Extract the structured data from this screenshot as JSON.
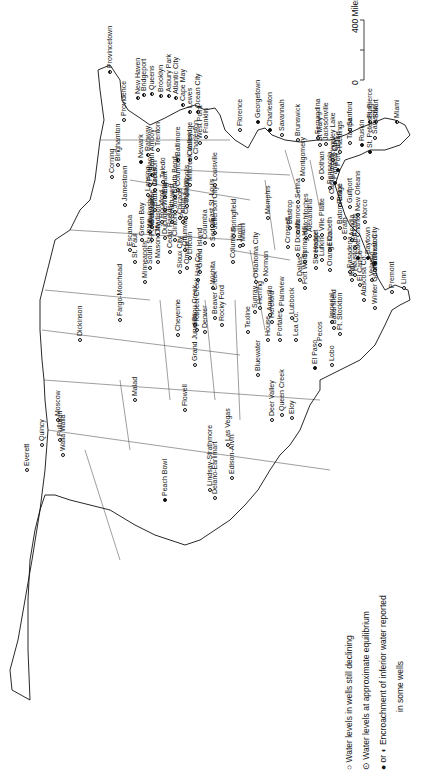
{
  "map": {
    "orientation": "rotated 90 degrees counter-clockwise",
    "scale_bar": {
      "start": "0",
      "end": "400 Miles"
    },
    "legend": [
      {
        "symbol": "open-circle",
        "text": "Water levels in wells still declining"
      },
      {
        "symbol": "circle-with-dot",
        "text": "Water levels at approximate equilibrium"
      },
      {
        "symbol": "half-filled-circle",
        "prefix": "● or",
        "text": "Encroachment of inferior water reported"
      },
      {
        "symbol": "",
        "text": "in some wells"
      }
    ],
    "places": [
      {
        "name": "Provincetown",
        "x": 110,
        "y": 72,
        "type": "enc"
      },
      {
        "name": "Providence",
        "x": 124,
        "y": 120,
        "type": "decl"
      },
      {
        "name": "New Haven",
        "x": 138,
        "y": 98,
        "type": "enc"
      },
      {
        "name": "Bridgeport",
        "x": 144,
        "y": 95,
        "type": "enc"
      },
      {
        "name": "Queens",
        "x": 152,
        "y": 94,
        "type": "enc"
      },
      {
        "name": "Brooklyn",
        "x": 161,
        "y": 96,
        "type": "enc"
      },
      {
        "name": "Asbury Park",
        "x": 169,
        "y": 96,
        "type": "enc"
      },
      {
        "name": "Atlantic City",
        "x": 176,
        "y": 98,
        "type": "enc"
      },
      {
        "name": "Cape May",
        "x": 183,
        "y": 105,
        "type": "enc"
      },
      {
        "name": "Lewes",
        "x": 190,
        "y": 112,
        "type": "enc"
      },
      {
        "name": "Ocean City",
        "x": 198,
        "y": 112,
        "type": "enc"
      },
      {
        "name": "Newark",
        "x": 141,
        "y": 162,
        "type": "full"
      },
      {
        "name": "Rahway",
        "x": 148,
        "y": 155,
        "type": "enc"
      },
      {
        "name": "South Amboy",
        "x": 152,
        "y": 175,
        "type": "enc"
      },
      {
        "name": "Trenton",
        "x": 158,
        "y": 150,
        "type": "decl"
      },
      {
        "name": "Binghamton",
        "x": 118,
        "y": 165,
        "type": "decl"
      },
      {
        "name": "Corning",
        "x": 112,
        "y": 177,
        "type": "decl"
      },
      {
        "name": "Jamestown",
        "x": 125,
        "y": 205,
        "type": "decl"
      },
      {
        "name": "Baltimore",
        "x": 178,
        "y": 160,
        "type": "enc"
      },
      {
        "name": "Cambridge",
        "x": 190,
        "y": 160,
        "type": "enc"
      },
      {
        "name": "West Point",
        "x": 200,
        "y": 143,
        "type": "eq"
      },
      {
        "name": "Franklin",
        "x": 206,
        "y": 137,
        "type": "eq"
      },
      {
        "name": "Charleston (WV)",
        "x": 196,
        "y": 158,
        "type": "decl"
      },
      {
        "name": "Florence",
        "x": 240,
        "y": 130,
        "type": "decl"
      },
      {
        "name": "Georgetown",
        "x": 258,
        "y": 122,
        "type": "full"
      },
      {
        "name": "Charleston",
        "x": 270,
        "y": 130,
        "type": "full"
      },
      {
        "name": "Savannah",
        "x": 282,
        "y": 135,
        "type": "decl"
      },
      {
        "name": "Brunswick",
        "x": 298,
        "y": 140,
        "type": "eq"
      },
      {
        "name": "Fernandina",
        "x": 318,
        "y": 138,
        "type": "eq"
      },
      {
        "name": "Jacksonville",
        "x": 326,
        "y": 144,
        "type": "eq"
      },
      {
        "name": "St Mary's",
        "x": 320,
        "y": 145,
        "type": "eq"
      },
      {
        "name": "Hastings",
        "x": 340,
        "y": 152,
        "type": "eq"
      },
      {
        "name": "Sanford",
        "x": 350,
        "y": 130,
        "type": "decl"
      },
      {
        "name": "Kingsley Lake",
        "x": 333,
        "y": 160,
        "type": "decl"
      },
      {
        "name": "Tampa",
        "x": 350,
        "y": 143,
        "type": "decl"
      },
      {
        "name": "Ruskin",
        "x": 362,
        "y": 145,
        "type": "full"
      },
      {
        "name": "Ft. Pierce",
        "x": 370,
        "y": 122,
        "type": "enc"
      },
      {
        "name": "Stuart",
        "x": 376,
        "y": 122,
        "type": "enc"
      },
      {
        "name": "Miami",
        "x": 397,
        "y": 122,
        "type": "enc"
      },
      {
        "name": "Sarasota",
        "x": 375,
        "y": 138,
        "type": "decl"
      },
      {
        "name": "St. Petersburg",
        "x": 370,
        "y": 152,
        "type": "full"
      },
      {
        "name": "Port St Joe",
        "x": 338,
        "y": 170,
        "type": "full"
      },
      {
        "name": "Panama City",
        "x": 335,
        "y": 183,
        "type": "full"
      },
      {
        "name": "Montgomery",
        "x": 303,
        "y": 180,
        "type": "eq"
      },
      {
        "name": "Dothan",
        "x": 322,
        "y": 178,
        "type": "eq"
      },
      {
        "name": "Selma",
        "x": 298,
        "y": 202,
        "type": "eq"
      },
      {
        "name": "Pensacola",
        "x": 330,
        "y": 188,
        "type": "eq"
      },
      {
        "name": "Cantonment",
        "x": 332,
        "y": 198,
        "type": "eq"
      },
      {
        "name": "Biloxi",
        "x": 340,
        "y": 205,
        "type": "decl"
      },
      {
        "name": "Gulfport",
        "x": 350,
        "y": 207,
        "type": "decl"
      },
      {
        "name": "New Orleans",
        "x": 358,
        "y": 215,
        "type": "decl"
      },
      {
        "name": "Norco",
        "x": 365,
        "y": 222,
        "type": "decl"
      },
      {
        "name": "Baton Rouge",
        "x": 340,
        "y": 228,
        "type": "decl"
      },
      {
        "name": "Ville Platte",
        "x": 322,
        "y": 235,
        "type": "eq"
      },
      {
        "name": "Erath",
        "x": 345,
        "y": 238,
        "type": "decl"
      },
      {
        "name": "Acadia",
        "x": 352,
        "y": 240,
        "type": "decl"
      },
      {
        "name": "Jeff Davis",
        "x": 355,
        "y": 248,
        "type": "decl"
      },
      {
        "name": "Lake Charles",
        "x": 358,
        "y": 258,
        "type": "full"
      },
      {
        "name": "Baytown",
        "x": 368,
        "y": 258,
        "type": "full"
      },
      {
        "name": "Texas City",
        "x": 375,
        "y": 263,
        "type": "full"
      },
      {
        "name": "Velasco",
        "x": 372,
        "y": 280,
        "type": "decl"
      },
      {
        "name": "Galveston",
        "x": 375,
        "y": 270,
        "type": "decl"
      },
      {
        "name": "Elizabeth",
        "x": 330,
        "y": 250,
        "type": "decl"
      },
      {
        "name": "Memphis",
        "x": 268,
        "y": 218,
        "type": "decl"
      },
      {
        "name": "Bastrop",
        "x": 290,
        "y": 228,
        "type": "decl"
      },
      {
        "name": "Monroe",
        "x": 298,
        "y": 232,
        "type": "decl"
      },
      {
        "name": "Natchitoches",
        "x": 306,
        "y": 238,
        "type": "decl"
      },
      {
        "name": "Alexandria",
        "x": 310,
        "y": 236,
        "type": "decl"
      },
      {
        "name": "Crossett",
        "x": 288,
        "y": 247,
        "type": "decl"
      },
      {
        "name": "El Dorado",
        "x": 298,
        "y": 255,
        "type": "decl"
      },
      {
        "name": "Spring Hill",
        "x": 305,
        "y": 262,
        "type": "decl"
      },
      {
        "name": "Shreveport",
        "x": 316,
        "y": 268,
        "type": "decl"
      },
      {
        "name": "Lufkin",
        "x": 322,
        "y": 260,
        "type": "decl"
      },
      {
        "name": "Hodge",
        "x": 316,
        "y": 256,
        "type": "decl"
      },
      {
        "name": "Orange Co.",
        "x": 330,
        "y": 270,
        "type": "decl"
      },
      {
        "name": "Pasadena",
        "x": 350,
        "y": 272,
        "type": "decl"
      },
      {
        "name": "Houston",
        "x": 355,
        "y": 275,
        "type": "decl"
      },
      {
        "name": "Katy",
        "x": 352,
        "y": 280,
        "type": "decl"
      },
      {
        "name": "El Campo",
        "x": 360,
        "y": 285,
        "type": "decl"
      },
      {
        "name": "Premont",
        "x": 392,
        "y": 292,
        "type": "decl"
      },
      {
        "name": "Linn",
        "x": 404,
        "y": 288,
        "type": "decl"
      },
      {
        "name": "Atascosa Co.",
        "x": 364,
        "y": 300,
        "type": "eq"
      },
      {
        "name": "Winter Garden",
        "x": 375,
        "y": 308,
        "type": "decl"
      },
      {
        "name": "Dallas",
        "x": 300,
        "y": 280,
        "type": "decl"
      },
      {
        "name": "Fort Worth",
        "x": 305,
        "y": 288,
        "type": "decl"
      },
      {
        "name": "Imperial",
        "x": 332,
        "y": 322,
        "type": "decl"
      },
      {
        "name": "Bakersfield",
        "x": 334,
        "y": 328,
        "type": "decl"
      },
      {
        "name": "Ft. Stockton",
        "x": 340,
        "y": 334,
        "type": "decl"
      },
      {
        "name": "Pecos",
        "x": 320,
        "y": 345,
        "type": "decl"
      },
      {
        "name": "Lobo",
        "x": 332,
        "y": 365,
        "type": "decl"
      },
      {
        "name": "El Paso",
        "x": 315,
        "y": 368,
        "type": "full"
      },
      {
        "name": "Lubbock",
        "x": 292,
        "y": 318,
        "type": "decl"
      },
      {
        "name": "Plainview",
        "x": 282,
        "y": 310,
        "type": "decl"
      },
      {
        "name": "Hereford",
        "x": 272,
        "y": 322,
        "type": "decl"
      },
      {
        "name": "Amarillo",
        "x": 270,
        "y": 315,
        "type": "decl"
      },
      {
        "name": "Herring",
        "x": 260,
        "y": 308,
        "type": "decl"
      },
      {
        "name": "Sunray",
        "x": 255,
        "y": 312,
        "type": "decl"
      },
      {
        "name": "Texline",
        "x": 248,
        "y": 332,
        "type": "decl"
      },
      {
        "name": "House",
        "x": 268,
        "y": 340,
        "type": "decl"
      },
      {
        "name": "Portales",
        "x": 280,
        "y": 340,
        "type": "decl"
      },
      {
        "name": "Lea Co.",
        "x": 296,
        "y": 340,
        "type": "decl"
      },
      {
        "name": "Bluewater",
        "x": 258,
        "y": 375,
        "type": "decl"
      },
      {
        "name": "Norman",
        "x": 266,
        "y": 280,
        "type": "eq"
      },
      {
        "name": "Oklahoma City",
        "x": 256,
        "y": 282,
        "type": "eq"
      },
      {
        "name": "Miami (OK)",
        "x": 243,
        "y": 245,
        "type": "decl"
      },
      {
        "name": "Columbus",
        "x": 233,
        "y": 262,
        "type": "decl"
      },
      {
        "name": "Joplin",
        "x": 240,
        "y": 246,
        "type": "decl"
      },
      {
        "name": "Springfield",
        "x": 234,
        "y": 236,
        "type": "decl"
      },
      {
        "name": "Jefferson City",
        "x": 215,
        "y": 233,
        "type": "decl"
      },
      {
        "name": "Sedalia",
        "x": 213,
        "y": 245,
        "type": "eq"
      },
      {
        "name": "Columbia",
        "x": 205,
        "y": 243,
        "type": "decl"
      },
      {
        "name": "East St. Louis",
        "x": 212,
        "y": 226,
        "type": "eq"
      },
      {
        "name": "Champaign",
        "x": 186,
        "y": 218,
        "type": "eq"
      },
      {
        "name": "Indianapolis",
        "x": 187,
        "y": 206,
        "type": "eq"
      },
      {
        "name": "South Bend",
        "x": 175,
        "y": 197,
        "type": "eq"
      },
      {
        "name": "Elkhart",
        "x": 165,
        "y": 197,
        "type": "eq"
      },
      {
        "name": "Columbus (OH)",
        "x": 178,
        "y": 190,
        "type": "eq"
      },
      {
        "name": "Millcreek Valley",
        "x": 190,
        "y": 185,
        "type": "decl"
      },
      {
        "name": "Louisville",
        "x": 215,
        "y": 185,
        "type": "eq"
      },
      {
        "name": "Toledo",
        "x": 163,
        "y": 182,
        "type": "decl"
      },
      {
        "name": "Jackson",
        "x": 155,
        "y": 190,
        "type": "eq"
      },
      {
        "name": "Pontiac",
        "x": 150,
        "y": 185,
        "type": "decl"
      },
      {
        "name": "Lansing",
        "x": 148,
        "y": 195,
        "type": "decl"
      },
      {
        "name": "Battle Creek",
        "x": 155,
        "y": 210,
        "type": "eq"
      },
      {
        "name": "Whiting",
        "x": 165,
        "y": 210,
        "type": "eq"
      },
      {
        "name": "Joliet",
        "x": 175,
        "y": 212,
        "type": "decl"
      },
      {
        "name": "Chicago",
        "x": 180,
        "y": 218,
        "type": "decl"
      },
      {
        "name": "South west",
        "x": 172,
        "y": 222,
        "type": "decl"
      },
      {
        "name": "Peoria",
        "x": 183,
        "y": 222,
        "type": "decl"
      },
      {
        "name": "Rockford",
        "x": 162,
        "y": 222,
        "type": "eq"
      },
      {
        "name": "Milwaukee",
        "x": 152,
        "y": 227,
        "type": "decl"
      },
      {
        "name": "Waukesha",
        "x": 150,
        "y": 232,
        "type": "decl"
      },
      {
        "name": "Madison",
        "x": 158,
        "y": 235,
        "type": "eq"
      },
      {
        "name": "Fond du Lac",
        "x": 152,
        "y": 240,
        "type": "decl"
      },
      {
        "name": "Green Bay",
        "x": 142,
        "y": 240,
        "type": "decl"
      },
      {
        "name": "Escanaba",
        "x": 130,
        "y": 250,
        "type": "decl"
      },
      {
        "name": "Dubuque",
        "x": 165,
        "y": 238,
        "type": "eq"
      },
      {
        "name": "Clinton",
        "x": 175,
        "y": 240,
        "type": "decl"
      },
      {
        "name": "Cedar Rapids",
        "x": 170,
        "y": 252,
        "type": "decl"
      },
      {
        "name": "Ottumwa",
        "x": 185,
        "y": 250,
        "type": "decl"
      },
      {
        "name": "Mason City",
        "x": 158,
        "y": 262,
        "type": "decl"
      },
      {
        "name": "St. Paul",
        "x": 135,
        "y": 262,
        "type": "eq"
      },
      {
        "name": "South St. Paul",
        "x": 150,
        "y": 268,
        "type": "decl"
      },
      {
        "name": "Minneapolis",
        "x": 145,
        "y": 282,
        "type": "eq"
      },
      {
        "name": "Fargo-Moorhead",
        "x": 120,
        "y": 320,
        "type": "decl"
      },
      {
        "name": "Dickinson",
        "x": 80,
        "y": 340,
        "type": "eq"
      },
      {
        "name": "Sioux City",
        "x": 180,
        "y": 272,
        "type": "decl"
      },
      {
        "name": "Omaha",
        "x": 187,
        "y": 268,
        "type": "decl"
      },
      {
        "name": "Lincoln",
        "x": 190,
        "y": 258,
        "type": "eq"
      },
      {
        "name": "Grand Island",
        "x": 200,
        "y": 272,
        "type": "eq"
      },
      {
        "name": "Hall Co.",
        "x": 198,
        "y": 280,
        "type": "eq"
      },
      {
        "name": "Wichita",
        "x": 213,
        "y": 288,
        "type": "eq"
      },
      {
        "name": "Beaver Creek",
        "x": 215,
        "y": 318,
        "type": "decl"
      },
      {
        "name": "Cheyenne",
        "x": 178,
        "y": 335,
        "type": "eq"
      },
      {
        "name": "Bijou Creek",
        "x": 195,
        "y": 325,
        "type": "decl"
      },
      {
        "name": "Prospect Creek",
        "x": 197,
        "y": 330,
        "type": "decl"
      },
      {
        "name": "Denver",
        "x": 205,
        "y": 332,
        "type": "eq"
      },
      {
        "name": "Rocky Ford",
        "x": 222,
        "y": 325,
        "type": "eq"
      },
      {
        "name": "Grand Junction",
        "x": 195,
        "y": 365,
        "type": "decl"
      },
      {
        "name": "Malad",
        "x": 135,
        "y": 400,
        "type": "eq"
      },
      {
        "name": "Flowell",
        "x": 185,
        "y": 410,
        "type": "eq"
      },
      {
        "name": "Moscow",
        "x": 58,
        "y": 420,
        "type": "decl"
      },
      {
        "name": "Quincy",
        "x": 42,
        "y": 445,
        "type": "eq"
      },
      {
        "name": "Pullman",
        "x": 60,
        "y": 440,
        "type": "decl"
      },
      {
        "name": "Walla Walla",
        "x": 63,
        "y": 455,
        "type": "decl"
      },
      {
        "name": "Everett",
        "x": 27,
        "y": 470,
        "type": "decl"
      },
      {
        "name": "Deer Valley",
        "x": 272,
        "y": 420,
        "type": "decl"
      },
      {
        "name": "Queen Creek",
        "x": 282,
        "y": 415,
        "type": "decl"
      },
      {
        "name": "Eloy",
        "x": 292,
        "y": 418,
        "type": "decl"
      },
      {
        "name": "Las Vegas",
        "x": 228,
        "y": 445,
        "type": "decl"
      },
      {
        "name": "Edison-Arvin",
        "x": 232,
        "y": 478,
        "type": "decl"
      },
      {
        "name": "Lindsay-Strathmore",
        "x": 210,
        "y": 490,
        "type": "decl"
      },
      {
        "name": "Delano-Earlimart",
        "x": 215,
        "y": 498,
        "type": "decl"
      },
      {
        "name": "Peach Bowl",
        "x": 165,
        "y": 500,
        "type": "full"
      }
    ]
  }
}
